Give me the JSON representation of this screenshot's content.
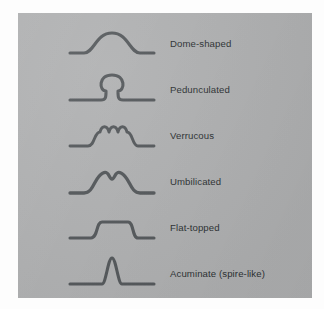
{
  "figure": {
    "panel_color": "#b0b1b2",
    "page_color": "#fdfdfd",
    "stroke_color": "#55595c",
    "label_color": "#2e3234"
  },
  "rows": [
    {
      "id": "dome-shaped",
      "label": "Dome-shaped",
      "icon": "dome-shaped-profile-icon",
      "path": "M 2 30 L 16 30 C 26 30 28 10 44 10 C 60 10 62 30 72 30 L 86 30"
    },
    {
      "id": "pedunculated",
      "label": "Pedunculated",
      "icon": "pedunculated-profile-icon",
      "path": "M 2 31 L 33 31 C 38 31 38 28 38 22 C 31 22 30 6 44 6 C 58 6 57 22 50 22 C 50 28 50 31 55 31 L 86 31"
    },
    {
      "id": "verrucous",
      "label": "Verrucous",
      "icon": "verrucous-profile-icon",
      "path": "M 2 31 L 20 31 C 27 31 26 17 32 17 C 34 10 39 10 41 17 C 43 10 48 10 50 17 C 52 10 57 10 59 17 C 65 17 64 31 70 31 L 86 31"
    },
    {
      "id": "umbilicated",
      "label": "Umbilicated",
      "icon": "umbilicated-profile-icon",
      "path": "M 2 32 L 16 32 C 26 32 26 16 35 12 C 41 9 41 18 44 18 C 47 18 47 9 53 12 C 62 16 62 32 72 32 L 86 32"
    },
    {
      "id": "flat-topped",
      "label": "Flat-topped",
      "icon": "flat-topped-profile-icon",
      "path": "M 2 31 L 23 31 C 30 31 28 15 34 15 L 60 15 C 66 15 64 31 70 31 L 86 31"
    },
    {
      "id": "acuminate",
      "label": "Acuminate (spire-like)",
      "icon": "acuminate-profile-icon",
      "path": "M 2 31 L 34 31 C 38 31 40 5 44 5 C 48 5 50 31 54 31 L 86 31"
    }
  ]
}
